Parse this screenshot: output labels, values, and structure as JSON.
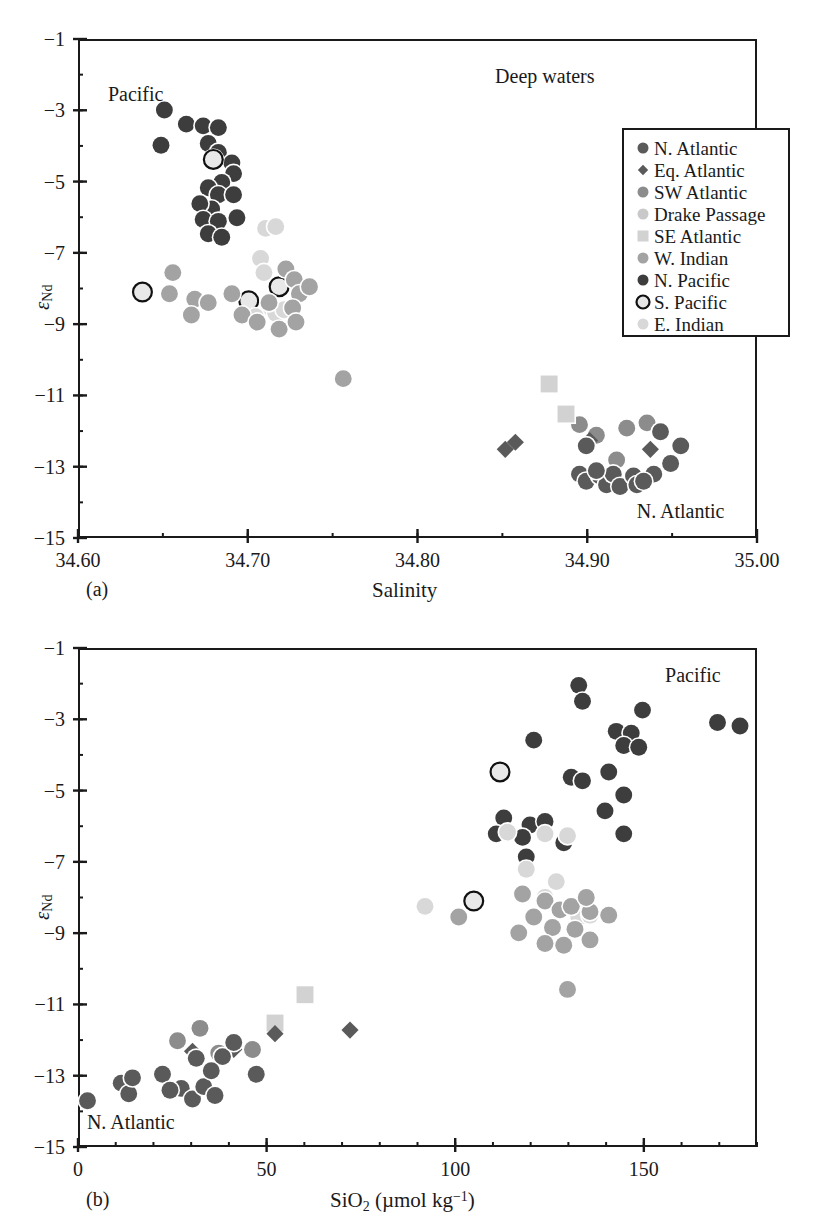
{
  "figure": {
    "top_caption_fragment": "",
    "legend": {
      "box": {
        "x": 622,
        "y": 128,
        "w": 168,
        "h": 209
      },
      "items": [
        {
          "label": "N. Atlantic",
          "marker": "circle",
          "color": "#5a5a5a",
          "size": 11,
          "edge": "none"
        },
        {
          "label": "Eq. Atlantic",
          "marker": "diamond",
          "color": "#5a5a5a",
          "size": 9,
          "edge": "none"
        },
        {
          "label": "SW Atlantic",
          "marker": "circle",
          "color": "#8c8c8c",
          "size": 11,
          "edge": "none"
        },
        {
          "label": "Drake Passage",
          "marker": "circle",
          "color": "#c9c9c9",
          "size": 11,
          "edge": "none"
        },
        {
          "label": "SE Atlantic",
          "marker": "square",
          "color": "#d2d2d2",
          "size": 11,
          "edge": "none"
        },
        {
          "label": "W. Indian",
          "marker": "circle",
          "color": "#a3a3a3",
          "size": 11,
          "edge": "none"
        },
        {
          "label": "N. Pacific",
          "marker": "circle",
          "color": "#3d3d3d",
          "size": 11,
          "edge": "none"
        },
        {
          "label": "S. Pacific",
          "marker": "circle",
          "color": "#e6e6e6",
          "size": 13,
          "edge": "#111111"
        },
        {
          "label": "E. Indian",
          "marker": "circle",
          "color": "#d8d8d8",
          "size": 11,
          "edge": "none"
        }
      ]
    }
  },
  "chart_data": [
    {
      "id": "panel-a",
      "type": "scatter",
      "panel_label": "(a)",
      "title": "",
      "xlabel": "Salinity",
      "ylabel": "εNd",
      "ylabel_base": "ε",
      "ylabel_sub": "Nd",
      "xlim": [
        34.6,
        35.0
      ],
      "ylim": [
        -15,
        -1
      ],
      "xticks": [
        34.6,
        34.7,
        34.8,
        34.9,
        35.0
      ],
      "xticklabels": [
        "34.60",
        "34.70",
        "34.80",
        "34.90",
        "35.00"
      ],
      "xminor_step": 0.05,
      "yticks": [
        -15,
        -13,
        -11,
        -9,
        -7,
        -5,
        -3,
        -1
      ],
      "yticklabels": [
        "−15",
        "−13",
        "−11",
        "−9",
        "−7",
        "−5",
        "−3",
        "−1"
      ],
      "yminor_step": 1,
      "grid": false,
      "annotations": [
        {
          "text": "Deep waters",
          "x": 34.875,
          "y": -2.05
        },
        {
          "text": "Pacific",
          "x": 34.634,
          "y": -2.55
        },
        {
          "text": "N. Atlantic",
          "x": 34.955,
          "y": -14.25
        }
      ],
      "series": [
        {
          "name": "N. Pacific",
          "marker": "circle",
          "color": "#3d3d3d",
          "size": 17,
          "edge": "none",
          "points": [
            [
              34.65,
              -2.95
            ],
            [
              34.663,
              -3.35
            ],
            [
              34.673,
              -3.4
            ],
            [
              34.682,
              -3.45
            ],
            [
              34.648,
              -3.95
            ],
            [
              34.676,
              -3.9
            ],
            [
              34.682,
              -4.15
            ],
            [
              34.69,
              -4.45
            ],
            [
              34.691,
              -4.75
            ],
            [
              34.684,
              -5.0
            ],
            [
              34.676,
              -5.15
            ],
            [
              34.682,
              -5.35
            ],
            [
              34.678,
              -5.75
            ],
            [
              34.671,
              -5.6
            ],
            [
              34.673,
              -6.05
            ],
            [
              34.682,
              -6.1
            ],
            [
              34.676,
              -6.45
            ],
            [
              34.691,
              -5.35
            ],
            [
              34.693,
              -6.0
            ],
            [
              34.684,
              -6.55
            ]
          ]
        },
        {
          "name": "S. Pacific",
          "marker": "circle",
          "color": "#e8e8e8",
          "size": 19,
          "edge": "#111111",
          "points": [
            [
              34.679,
              -4.35
            ],
            [
              34.637,
              -8.1
            ],
            [
              34.7,
              -8.35
            ],
            [
              34.718,
              -7.95
            ]
          ]
        },
        {
          "name": "E. Indian",
          "marker": "circle",
          "color": "#d8d8d8",
          "size": 17,
          "edge": "none",
          "points": [
            [
              34.71,
              -6.3
            ],
            [
              34.716,
              -6.25
            ],
            [
              34.707,
              -7.15
            ],
            [
              34.709,
              -7.55
            ],
            [
              34.713,
              -8.55
            ],
            [
              34.716,
              -8.7
            ],
            [
              34.721,
              -8.6
            ],
            [
              34.704,
              -8.8
            ]
          ]
        },
        {
          "name": "W. Indian",
          "marker": "circle",
          "color": "#a3a3a3",
          "size": 17,
          "edge": "none",
          "points": [
            [
              34.655,
              -7.55
            ],
            [
              34.653,
              -8.15
            ],
            [
              34.668,
              -8.3
            ],
            [
              34.666,
              -8.75
            ],
            [
              34.676,
              -8.4
            ],
            [
              34.69,
              -8.15
            ],
            [
              34.696,
              -8.75
            ],
            [
              34.705,
              -8.95
            ],
            [
              34.712,
              -8.4
            ],
            [
              34.722,
              -7.45
            ],
            [
              34.727,
              -7.75
            ],
            [
              34.73,
              -8.15
            ],
            [
              34.736,
              -7.95
            ],
            [
              34.726,
              -8.55
            ],
            [
              34.718,
              -9.15
            ],
            [
              34.728,
              -8.95
            ],
            [
              34.756,
              -10.55
            ]
          ]
        },
        {
          "name": "SW Atlantic",
          "marker": "circle",
          "color": "#8c8c8c",
          "size": 17,
          "edge": "none",
          "points": [
            [
              34.896,
              -11.85
            ],
            [
              34.906,
              -12.15
            ],
            [
              34.924,
              -11.95
            ],
            [
              34.936,
              -11.8
            ],
            [
              34.918,
              -12.85
            ]
          ]
        },
        {
          "name": "SE Atlantic",
          "marker": "square",
          "color": "#d2d2d2",
          "size": 17,
          "edge": "none",
          "points": [
            [
              34.878,
              -10.7
            ],
            [
              34.888,
              -11.55
            ]
          ]
        },
        {
          "name": "Eq. Atlantic",
          "marker": "diamond",
          "color": "#5a5a5a",
          "size": 15,
          "edge": "none",
          "points": [
            [
              34.858,
              -12.35
            ],
            [
              34.852,
              -12.55
            ],
            [
              34.902,
              -12.3
            ],
            [
              34.938,
              -12.55
            ]
          ]
        },
        {
          "name": "N. Atlantic",
          "marker": "circle",
          "color": "#5a5a5a",
          "size": 17,
          "edge": "none",
          "points": [
            [
              34.9,
              -12.45
            ],
            [
              34.944,
              -12.05
            ],
            [
              34.896,
              -13.25
            ],
            [
              34.9,
              -13.45
            ],
            [
              34.908,
              -13.3
            ],
            [
              34.912,
              -13.55
            ],
            [
              34.916,
              -13.25
            ],
            [
              34.92,
              -13.6
            ],
            [
              34.928,
              -13.3
            ],
            [
              34.93,
              -13.55
            ],
            [
              34.94,
              -13.25
            ],
            [
              34.95,
              -12.95
            ],
            [
              34.956,
              -12.45
            ],
            [
              34.906,
              -13.15
            ],
            [
              34.934,
              -13.45
            ]
          ]
        }
      ]
    },
    {
      "id": "panel-b",
      "type": "scatter",
      "panel_label": "(b)",
      "title": "",
      "xlabel": "SiO2 (µmol kg-1)",
      "xlabel_main": "SiO",
      "xlabel_sub": "2",
      "xlabel_unit_open": " (µmol kg",
      "xlabel_unit_sup": "−1",
      "xlabel_unit_close": ")",
      "ylabel": "εNd",
      "ylabel_base": "ε",
      "ylabel_sub": "Nd",
      "xlim": [
        0,
        180
      ],
      "ylim": [
        -15,
        -1
      ],
      "xticks": [
        0,
        50,
        100,
        150
      ],
      "xticklabels": [
        "0",
        "50",
        "100",
        "150"
      ],
      "xminor_step": 10,
      "yticks": [
        -15,
        -13,
        -11,
        -9,
        -7,
        -5,
        -3,
        -1
      ],
      "yticklabels": [
        "−15",
        "−13",
        "−11",
        "−9",
        "−7",
        "−5",
        "−3",
        "−1"
      ],
      "yminor_step": 1,
      "grid": false,
      "annotations": [
        {
          "text": "Pacific",
          "x": 163,
          "y": -1.75
        },
        {
          "text": "N. Atlantic",
          "x": 14,
          "y": -14.3
        }
      ],
      "series": [
        {
          "name": "N. Pacific",
          "marker": "circle",
          "color": "#3d3d3d",
          "size": 17,
          "edge": "none",
          "points": [
            [
              133,
              -2.0
            ],
            [
              134,
              -2.45
            ],
            [
              150,
              -2.7
            ],
            [
              170,
              -3.05
            ],
            [
              176,
              -3.15
            ],
            [
              143,
              -3.3
            ],
            [
              147,
              -3.35
            ],
            [
              145,
              -3.7
            ],
            [
              149,
              -3.75
            ],
            [
              121,
              -3.55
            ],
            [
              131,
              -4.6
            ],
            [
              134,
              -4.7
            ],
            [
              141,
              -4.45
            ],
            [
              145,
              -5.1
            ],
            [
              140,
              -5.55
            ],
            [
              145,
              -6.2
            ],
            [
              113,
              -5.75
            ],
            [
              120,
              -5.95
            ],
            [
              118,
              -6.3
            ],
            [
              119,
              -6.85
            ],
            [
              124,
              -5.85
            ],
            [
              129,
              -6.45
            ],
            [
              111,
              -6.2
            ]
          ]
        },
        {
          "name": "S. Pacific",
          "marker": "circle",
          "color": "#e8e8e8",
          "size": 19,
          "edge": "#111111",
          "points": [
            [
              112,
              -4.45
            ],
            [
              105,
              -8.1
            ],
            [
              135,
              -8.35
            ]
          ]
        },
        {
          "name": "E. Indian",
          "marker": "circle",
          "color": "#d8d8d8",
          "size": 17,
          "edge": "none",
          "points": [
            [
              114,
              -6.15
            ],
            [
              124,
              -6.2
            ],
            [
              130,
              -6.25
            ],
            [
              119,
              -7.2
            ],
            [
              127,
              -7.55
            ],
            [
              92,
              -8.25
            ],
            [
              124,
              -8.0
            ],
            [
              133,
              -8.55
            ],
            [
              136,
              -8.5
            ]
          ]
        },
        {
          "name": "W. Indian",
          "marker": "circle",
          "color": "#a3a3a3",
          "size": 17,
          "edge": "none",
          "points": [
            [
              118,
              -7.9
            ],
            [
              124,
              -8.1
            ],
            [
              121,
              -8.55
            ],
            [
              128,
              -8.35
            ],
            [
              131,
              -8.25
            ],
            [
              136,
              -8.4
            ],
            [
              141,
              -8.5
            ],
            [
              126,
              -8.85
            ],
            [
              132,
              -8.9
            ],
            [
              101,
              -8.55
            ],
            [
              117,
              -9.0
            ],
            [
              124,
              -9.3
            ],
            [
              129,
              -9.35
            ],
            [
              136,
              -9.2
            ],
            [
              130,
              -10.6
            ],
            [
              135,
              -8.0
            ]
          ]
        },
        {
          "name": "SW Atlantic",
          "marker": "circle",
          "color": "#8c8c8c",
          "size": 17,
          "edge": "none",
          "points": [
            [
              32,
              -11.7
            ],
            [
              37,
              -12.4
            ],
            [
              46,
              -12.3
            ],
            [
              26,
              -12.05
            ]
          ]
        },
        {
          "name": "SE Atlantic",
          "marker": "square",
          "color": "#d2d2d2",
          "size": 17,
          "edge": "none",
          "points": [
            [
              60,
              -10.75
            ],
            [
              52,
              -11.55
            ]
          ]
        },
        {
          "name": "Eq. Atlantic",
          "marker": "diamond",
          "color": "#5a5a5a",
          "size": 15,
          "edge": "none",
          "points": [
            [
              30,
              -12.35
            ],
            [
              41,
              -12.3
            ],
            [
              72,
              -11.75
            ],
            [
              52,
              -11.85
            ]
          ]
        },
        {
          "name": "N. Atlantic",
          "marker": "circle",
          "color": "#5a5a5a",
          "size": 17,
          "edge": "none",
          "points": [
            [
              2,
              -13.75
            ],
            [
              11,
              -13.25
            ],
            [
              13,
              -13.55
            ],
            [
              14,
              -13.1
            ],
            [
              22,
              -13.0
            ],
            [
              27,
              -13.4
            ],
            [
              30,
              -13.7
            ],
            [
              33,
              -13.35
            ],
            [
              36,
              -13.6
            ],
            [
              38,
              -12.5
            ],
            [
              41,
              -12.1
            ],
            [
              47,
              -13.0
            ],
            [
              31,
              -12.55
            ],
            [
              35,
              -12.9
            ],
            [
              24,
              -13.45
            ]
          ]
        }
      ]
    }
  ]
}
